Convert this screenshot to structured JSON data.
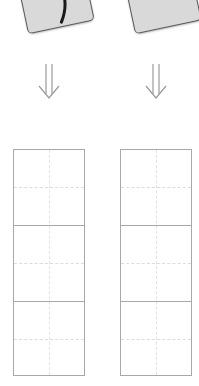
{
  "cards": [
    {
      "id": "left",
      "fill": "#d9d9d9",
      "border": "#5a5a5a",
      "has_stroke": true
    },
    {
      "id": "right",
      "fill": "#d9d9d9",
      "border": "#5a5a5a",
      "has_stroke": false
    }
  ],
  "arrows": [
    {
      "id": "left",
      "icon": "double-down-arrow-icon",
      "color": "#9a9a9a"
    },
    {
      "id": "right",
      "icon": "double-down-arrow-icon",
      "color": "#9a9a9a"
    }
  ],
  "grids": [
    {
      "id": "left",
      "columns": 2,
      "major_rows": 3,
      "minor_rows_per_major": 2,
      "border_color": "#a8a8a8",
      "guide_color": "#dcdcdc"
    },
    {
      "id": "right",
      "columns": 2,
      "major_rows": 3,
      "minor_rows_per_major": 2,
      "border_color": "#a8a8a8",
      "guide_color": "#dcdcdc"
    }
  ]
}
